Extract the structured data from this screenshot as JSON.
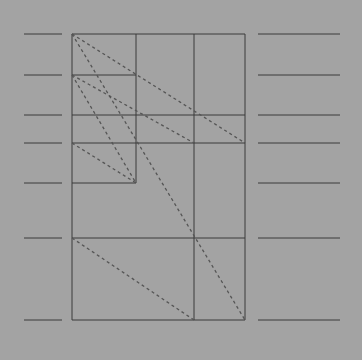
{
  "diagram": {
    "colors": {
      "background": "#a3a3a3",
      "line": "#3a3a3a",
      "dashed": "#555555"
    },
    "levels": [
      "top",
      "level-2",
      "level-3",
      "level-4",
      "level-5",
      "level-6",
      "bottom"
    ],
    "solid_segments": 10,
    "dashed_diagonals": 6
  }
}
